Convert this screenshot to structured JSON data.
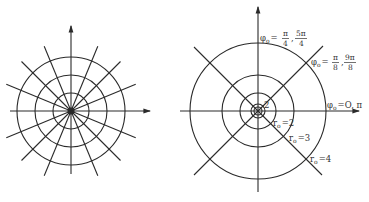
{
  "left_diagram": {
    "description": "Polar coordinate grid",
    "center": [
      71,
      111
    ],
    "circle_radii": [
      18,
      36,
      54
    ],
    "radial_line_count": 16,
    "radial_length": 70
  },
  "right_diagram": {
    "description": "Polar grid with level curves",
    "center": [
      258,
      111
    ],
    "circle_radii": [
      4,
      7,
      18,
      36,
      68
    ],
    "labels": {
      "phi_quarter": {
        "var": "φ",
        "sub": "o",
        "eq": "=",
        "f1_num": "π",
        "f1_den": "4",
        "sep": ",",
        "f2_num": "5π",
        "f2_den": "4"
      },
      "phi_eighth": {
        "var": "φ",
        "sub": "o",
        "eq": "=",
        "f1_num": "π",
        "f1_den": "8",
        "sep": ",",
        "f2_num": "9π",
        "f2_den": "8"
      },
      "phi_zero": {
        "var": "φ",
        "sub": "o",
        "text": "=O, π"
      },
      "r_one": "2",
      "r_two": {
        "var": "r",
        "sub": "o",
        "text": "=2"
      },
      "r_three": {
        "var": "r",
        "sub": "o",
        "text": "=3"
      },
      "r_four": {
        "var": "r",
        "sub": "o",
        "text": "=4"
      }
    }
  }
}
